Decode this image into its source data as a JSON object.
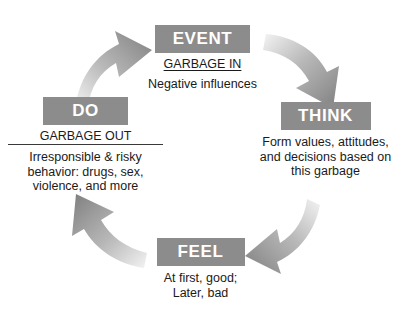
{
  "diagram": {
    "direction": "clockwise",
    "box_color": "#8c8c8c",
    "box_text_color": "#ffffff",
    "arrow_color": "#8c8c8c",
    "background": "#ffffff",
    "nodes": [
      {
        "id": "event",
        "label": "EVENT",
        "subtitle": "GARBAGE IN",
        "subtitle_underlined": true,
        "description": "Negative influences"
      },
      {
        "id": "think",
        "label": "THINK",
        "subtitle": "",
        "subtitle_underlined": false,
        "description": "Form values, attitudes,\nand decisions based on\nthis garbage"
      },
      {
        "id": "feel",
        "label": "FEEL",
        "subtitle": "",
        "subtitle_underlined": false,
        "description": "At first, good;\nLater, bad"
      },
      {
        "id": "do",
        "label": "DO",
        "subtitle": "GARBAGE OUT",
        "subtitle_underlined": true,
        "description": "Irresponsible & risky\nbehavior: drugs, sex,\nviolence, and more"
      }
    ],
    "arrows": [
      {
        "id": "do-to-event",
        "from": "DO",
        "to": "EVENT",
        "position": "top-left"
      },
      {
        "id": "event-to-think",
        "from": "EVENT",
        "to": "THINK",
        "position": "top-right"
      },
      {
        "id": "think-to-feel",
        "from": "THINK",
        "to": "FEEL",
        "position": "bottom-right"
      },
      {
        "id": "feel-to-do",
        "from": "FEEL",
        "to": "DO",
        "position": "bottom-left"
      }
    ]
  }
}
